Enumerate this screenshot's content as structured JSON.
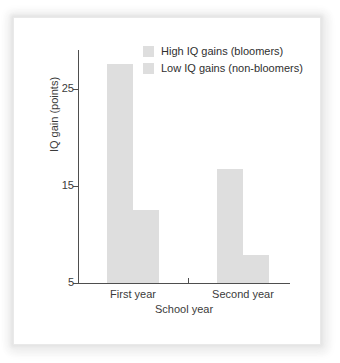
{
  "chart_data": {
    "type": "bar",
    "title": "",
    "subtitle": "",
    "xlabel": "School year",
    "ylabel": "IQ gain (points)",
    "categories": [
      "First year",
      "Second year"
    ],
    "series": [
      {
        "name": "High IQ gains (bloomers)",
        "color": "#dedede",
        "values": [
          27.6,
          16.7
        ]
      },
      {
        "name": "Low IQ gains (non-bloomers)",
        "color": "#dedede",
        "values": [
          12.5,
          7.9
        ]
      }
    ],
    "ylim": [
      5,
      29
    ],
    "yticks": [
      5,
      15,
      25
    ],
    "ytick_labels": [
      "5",
      "15",
      "25"
    ],
    "grid": false,
    "legend_position": "top-right",
    "bar_grouping": "adjacent"
  },
  "legend": {
    "items": [
      {
        "label": "High IQ gains (bloomers)",
        "swatch_color": "#dedede"
      },
      {
        "label": "Low IQ gains (non-bloomers)",
        "swatch_color": "#dedede"
      }
    ]
  },
  "axes": {
    "y_title": "IQ gain (points)",
    "x_title": "School year",
    "y_ticks": [
      "25",
      "15",
      "5"
    ],
    "x_ticks": [
      "First year",
      "Second year"
    ]
  },
  "style": {
    "bar_color": "#dedede",
    "axis_color": "#4e4e4e",
    "text_color": "#3b3b3b",
    "panel_background": "#ffffff"
  }
}
